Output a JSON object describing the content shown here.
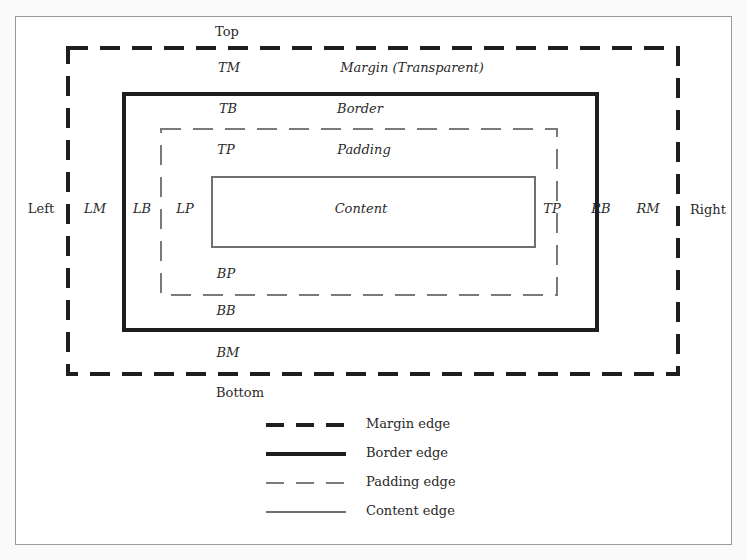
{
  "diagram": {
    "sides": {
      "top": "Top",
      "bottom": "Bottom",
      "left": "Left",
      "right": "Right"
    },
    "margin": {
      "label": "Margin (Transparent)",
      "top": "TM",
      "bottom": "BM",
      "left": "LM",
      "right": "RM"
    },
    "border": {
      "label": "Border",
      "top": "TB",
      "bottom": "BB",
      "left": "LB",
      "right": "RB"
    },
    "padding": {
      "label": "Padding",
      "top": "TP",
      "bottom": "BP",
      "left": "LP",
      "right": "TP"
    },
    "content": {
      "label": "Content"
    },
    "colors": {
      "margin_edge": "#1e1e1e",
      "border_edge": "#1e1e1e",
      "padding_edge": "#7a7a7a",
      "content_edge": "#707070"
    }
  },
  "legend": {
    "items": [
      {
        "label": "Margin edge",
        "style": "thick-dashed"
      },
      {
        "label": "Border edge",
        "style": "thick-solid"
      },
      {
        "label": "Padding edge",
        "style": "thin-dashed"
      },
      {
        "label": "Content edge",
        "style": "thin-solid"
      }
    ]
  }
}
